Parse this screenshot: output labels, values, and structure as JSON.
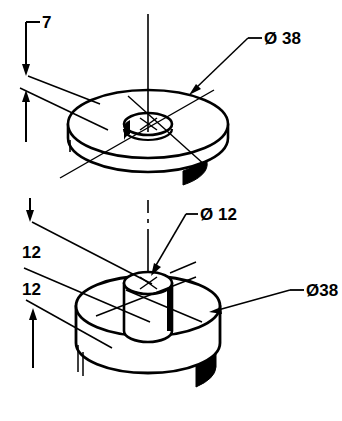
{
  "drawing": {
    "title": "Isometric part drawing - washer and flanged boss",
    "background_color": "#ffffff",
    "line_color": "#000000",
    "shade_color": "#000000",
    "units_note": "",
    "annotations": {
      "top_thickness": "7",
      "boss_height": "12",
      "flange_thickness": "12",
      "top_outer_diameter": "Ø 38",
      "boss_diameter": "Ø 12",
      "bottom_outer_diameter": "Ø38"
    },
    "parts": [
      {
        "name": "top-washer",
        "outer_diameter": "38",
        "bore_diameter": "12",
        "thickness": "7"
      },
      {
        "name": "bottom-flanged-boss",
        "flange_diameter": "38",
        "flange_thickness": "12",
        "boss_diameter": "12",
        "boss_height": "12"
      }
    ]
  }
}
